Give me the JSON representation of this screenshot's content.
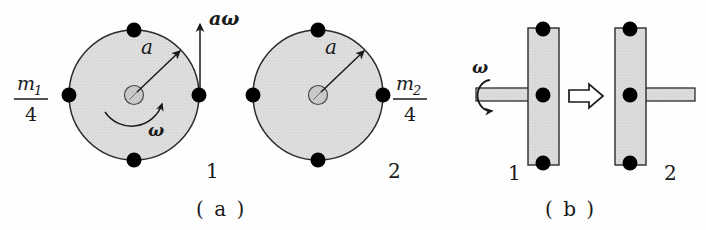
{
  "figure": {
    "panels": [
      {
        "key": "a",
        "caption": "( a )",
        "objects": [
          {
            "id": "disk-1",
            "number_label": "1",
            "radius_label": "a",
            "angular_velocity_label": "ω",
            "tangential_velocity_label": "aω",
            "mass_label_numerator": "m",
            "mass_label_subscript": "1",
            "mass_label_denominator": "4",
            "point_mass_count": 4,
            "center_x": 134,
            "center_y": 95,
            "radius": 65
          },
          {
            "id": "disk-2",
            "number_label": "2",
            "radius_label": "a",
            "mass_label_numerator": "m",
            "mass_label_subscript": "2",
            "mass_label_denominator": "4",
            "point_mass_count": 4,
            "center_x": 318,
            "center_y": 95,
            "radius": 65
          }
        ]
      },
      {
        "key": "b",
        "caption": "( b )",
        "objects": [
          {
            "id": "bar-1",
            "number_label": "1",
            "angular_velocity_label": "ω",
            "point_mass_count": 3
          },
          {
            "id": "bar-2",
            "number_label": "2",
            "point_mass_count": 3
          }
        ],
        "transition_arrow": "block-arrow-right"
      }
    ],
    "colors": {
      "ink": "#1a1a1a",
      "body_fill": "#dcdcdc",
      "body_stroke": "#2a2a2a",
      "point_mass_fill": "#000000",
      "hub_fill": "#c8c8c8",
      "background": "#fefefe"
    }
  }
}
